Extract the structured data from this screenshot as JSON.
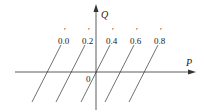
{
  "diagram": {
    "axes": {
      "x_label": "P",
      "y_label": "Q",
      "origin_label": "0"
    },
    "lines": [
      {
        "label": "0.0",
        "prime": "′"
      },
      {
        "label": "0.2",
        "prime": "′"
      },
      {
        "label": "0.4",
        "prime": "′"
      },
      {
        "label": "0.6",
        "prime": "′"
      },
      {
        "label": "0.8",
        "prime": "′"
      }
    ],
    "colors": {
      "line": "#333333",
      "text": "#222222",
      "background": "#ffffff"
    }
  }
}
